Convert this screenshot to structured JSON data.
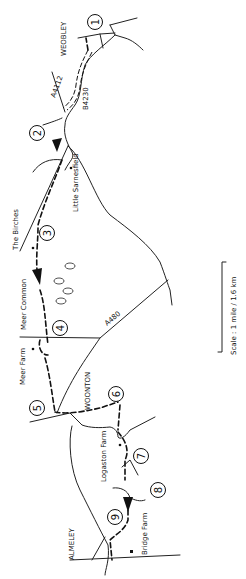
{
  "map": {
    "title": "Walking route map: Weobley to Almeley",
    "scale_label": "Scale : 1 mile / 1.6 km",
    "places": [
      {
        "id": "weobley",
        "label": "WEOBLEY"
      },
      {
        "id": "the-birches",
        "label": "The Birches"
      },
      {
        "id": "little-sarnesfield",
        "label": "Little Sarnesfield"
      },
      {
        "id": "meer-common",
        "label": "Meer Common"
      },
      {
        "id": "meer-farm",
        "label": "Meer Farm"
      },
      {
        "id": "woonton",
        "label": "WOONTON"
      },
      {
        "id": "logaston-farm",
        "label": "Logaston Farm"
      },
      {
        "id": "bridge-farm",
        "label": "Bridge Farm"
      },
      {
        "id": "almeley",
        "label": "ALMELEY"
      }
    ],
    "roads": [
      {
        "id": "a4112",
        "label": "A4112"
      },
      {
        "id": "b4230",
        "label": "B4230"
      },
      {
        "id": "a480",
        "label": "A480"
      }
    ],
    "waypoints": [
      "1",
      "2",
      "3",
      "4",
      "5",
      "6",
      "7",
      "8",
      "9"
    ]
  }
}
